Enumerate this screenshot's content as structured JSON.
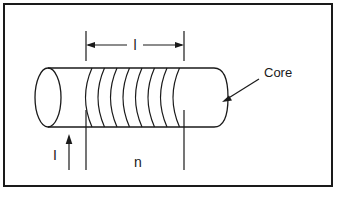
{
  "figure": {
    "background_color": "#ffffff",
    "ink_color": "#1a1a1a",
    "border": {
      "name": "figure-border",
      "x": 4,
      "y": 4,
      "width": 328,
      "height": 182,
      "stroke_width": 2
    }
  },
  "labels": {
    "length": "l",
    "current": "I",
    "turns": "n",
    "core": "Core"
  },
  "annotations": {
    "length_dimension": {
      "label": "l",
      "y": 45,
      "x_start": 86,
      "x_end": 184,
      "extension_top": 31,
      "extension_bottom": 61
    },
    "current_arrow": {
      "label": "I",
      "x": 84,
      "y_tail": 170,
      "y_head": 136
    },
    "turns_label": {
      "label": "n",
      "x": 140,
      "y": 163
    },
    "core_leader": {
      "label": "Core",
      "text_x": 264,
      "text_y": 75,
      "arrow_from_x": 258,
      "arrow_from_y": 79,
      "arrow_to_x": 222,
      "arrow_to_y": 101
    }
  },
  "solenoid": {
    "core_left_x": 48,
    "core_right_x": 228,
    "core_top_y": 68,
    "core_bottom_y": 127,
    "cap_radius_x": 14,
    "turn_count": 8,
    "turns_start_x": 92,
    "turns_spacing": 12.5,
    "leg_left_x": 86,
    "leg_right_x": 184,
    "leg_bottom_y": 170
  }
}
